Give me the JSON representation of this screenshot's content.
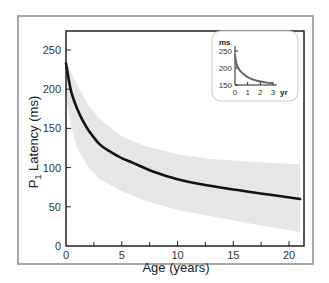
{
  "chart_data": {
    "type": "line",
    "title": "",
    "xlabel": "Age (years)",
    "ylabel_main": "P",
    "ylabel_sub": "1",
    "ylabel_rest": " Latency (ms)",
    "xlim": [
      0,
      21
    ],
    "ylim": [
      0,
      260
    ],
    "xticks": [
      0,
      5,
      10,
      15,
      20
    ],
    "xticks_minor": [
      2.5,
      7.5,
      12.5,
      17.5
    ],
    "yticks": [
      0,
      50,
      100,
      150,
      200,
      250
    ],
    "grid": false,
    "series": [
      {
        "name": "mean P1 latency",
        "color": "#111111",
        "x": [
          0,
          0.25,
          0.5,
          1,
          1.5,
          2,
          3,
          4,
          5,
          6,
          8,
          10,
          12,
          15,
          18,
          21
        ],
        "y": [
          233,
          212,
          195,
          175,
          160,
          148,
          130,
          120,
          112,
          106,
          94,
          85,
          79,
          72,
          66,
          60
        ]
      }
    ],
    "band": {
      "name": "normal range",
      "color": "#e6e6e6",
      "x": [
        0,
        0.5,
        1,
        2,
        3,
        5,
        7,
        10,
        13,
        16,
        21
      ],
      "upper": [
        236,
        220,
        205,
        180,
        162,
        140,
        128,
        117,
        111,
        108,
        104
      ],
      "lower": [
        190,
        150,
        125,
        100,
        85,
        70,
        58,
        46,
        38,
        30,
        18
      ]
    },
    "inset": {
      "xlabel_unit": "yr",
      "ylabel_unit": "ms",
      "xlim": [
        0,
        3.3
      ],
      "ylim": [
        150,
        260
      ],
      "xticks": [
        0,
        1,
        2,
        3
      ],
      "yticks": [
        150,
        200,
        250
      ],
      "series": {
        "color": "#666666",
        "x": [
          0,
          0.1,
          0.25,
          0.5,
          0.75,
          1,
          1.5,
          2,
          2.5,
          3
        ],
        "y": [
          240,
          215,
          200,
          188,
          180,
          173,
          165,
          160,
          157,
          156
        ]
      }
    }
  }
}
